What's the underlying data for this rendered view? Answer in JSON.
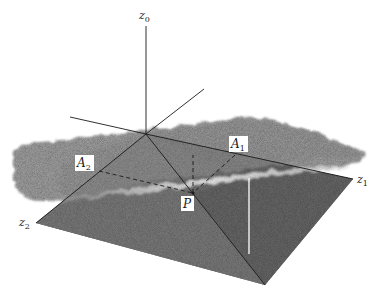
{
  "figure": {
    "type": "3d-simplex-diagram",
    "axes": {
      "z0": {
        "label": "z",
        "subscript": "0"
      },
      "z1": {
        "label": "z",
        "subscript": "1"
      },
      "z2": {
        "label": "z",
        "subscript": "2"
      }
    },
    "points": {
      "P": {
        "label": "P"
      },
      "A1": {
        "label": "A",
        "subscript": "1"
      },
      "A2": {
        "label": "A",
        "subscript": "2"
      }
    },
    "colors": {
      "surface_dark": "#6e6e6e",
      "surface_mid": "#8a8a8a",
      "cloud": "#a3a3a3",
      "highlight": "#f4f4f4",
      "line": "#1a1a1a",
      "background": "#ffffff"
    }
  }
}
